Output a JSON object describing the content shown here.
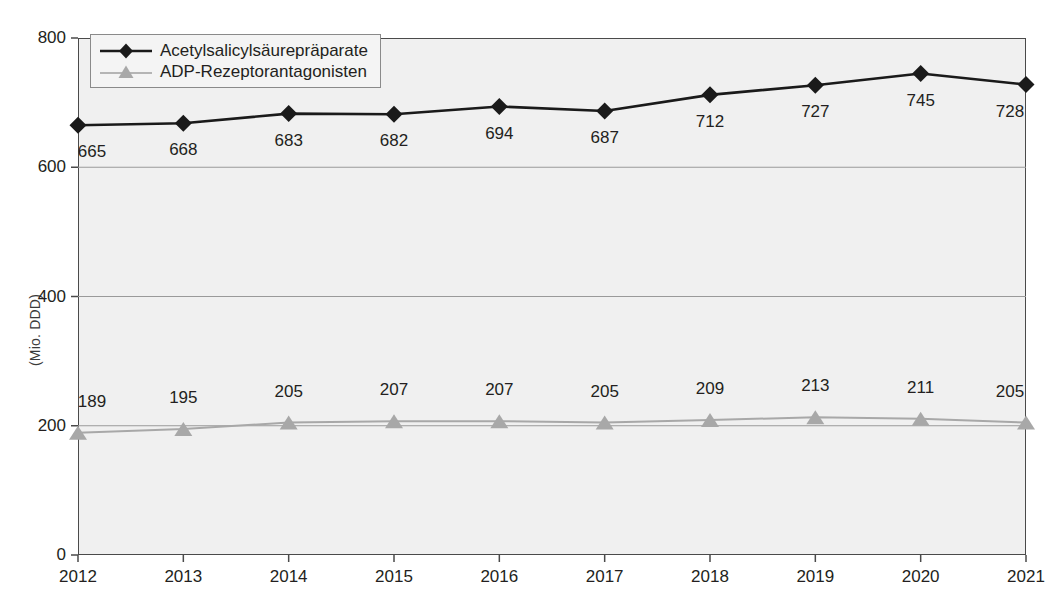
{
  "chart_data": {
    "type": "line",
    "title": "",
    "xlabel": "",
    "ylabel": "(Mio. DDD)",
    "categories": [
      "2012",
      "2013",
      "2014",
      "2015",
      "2016",
      "2017",
      "2018",
      "2019",
      "2020",
      "2021"
    ],
    "ylim": [
      0,
      800
    ],
    "yticks": [
      "0",
      "200",
      "400",
      "600",
      "800"
    ],
    "ytick_values": [
      0,
      200,
      400,
      600,
      800
    ],
    "grid": true,
    "legend_position": "top-left",
    "series": [
      {
        "name": "Acetylsalicylsäurepräparate",
        "marker": "diamond",
        "color": "#1a1a1a",
        "values": [
          665,
          668,
          683,
          682,
          694,
          687,
          712,
          727,
          745,
          728
        ]
      },
      {
        "name": "ADP-Rezeptorantagonisten",
        "marker": "triangle",
        "color": "#a8a8a8",
        "values": [
          189,
          195,
          205,
          207,
          207,
          205,
          209,
          213,
          211,
          205
        ]
      }
    ]
  },
  "legend": {
    "entries": [
      {
        "label": "Acetylsalicylsäurepräparate"
      },
      {
        "label": "ADP-Rezeptorantagonisten"
      }
    ]
  },
  "axes": {
    "y_title": "(Mio. DDD)",
    "y_ticks": [
      "800",
      "600",
      "400",
      "200",
      "0"
    ],
    "x_ticks": [
      "2012",
      "2013",
      "2014",
      "2015",
      "2016",
      "2017",
      "2018",
      "2019",
      "2020",
      "2021"
    ]
  },
  "colors": {
    "series1": "#1a1a1a",
    "series2": "#a8a8a8",
    "plot_background": "#f0f0f0",
    "frame": "#4a4a4a",
    "gridline": "#9a9a9a",
    "text": "#231f20"
  }
}
